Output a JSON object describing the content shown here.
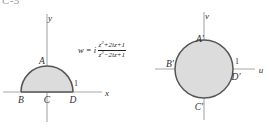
{
  "figure": {
    "corner_tag": "C-5",
    "background_color": "#ffffff",
    "fill_color": "#dcdcdc",
    "curve_color": "#555555",
    "axis_color": "#a8a8a8"
  },
  "mapping": {
    "lead": "w = i",
    "numerator": "z² + 2iz + 1",
    "denominator": "z² − 2iz + 1",
    "numerator_base": "z",
    "numerator_exp": "2",
    "numerator_rest": "+2iz+1",
    "denominator_base": "z",
    "denominator_exp": "2",
    "denominator_rest": "−2iz+1",
    "full": "w = i (z²+2iz+1)/(z²−2iz+1)"
  },
  "left_plane": {
    "name": "z-plane",
    "x_axis_label": "x",
    "y_axis_label": "y",
    "tick_label": "1",
    "region_description": "upper half unit disk (semicircle)",
    "points": [
      {
        "id": "A",
        "label": "A",
        "position": "top of semicircle"
      },
      {
        "id": "B",
        "label": "B",
        "position": "left end of diameter, x = -1"
      },
      {
        "id": "C",
        "label": "C",
        "position": "origin"
      },
      {
        "id": "D",
        "label": "D",
        "position": "right end of diameter, x = 1"
      }
    ]
  },
  "right_plane": {
    "name": "w-plane",
    "x_axis_label": "u",
    "y_axis_label": "v",
    "tick_label": "1",
    "region_description": "full unit disk",
    "points": [
      {
        "id": "A-prime",
        "label": "A′",
        "position": "top of circle"
      },
      {
        "id": "B-prime",
        "label": "B′",
        "position": "left of circle, u = -1"
      },
      {
        "id": "C-prime",
        "label": "C′",
        "position": "bottom of circle"
      },
      {
        "id": "D-prime",
        "label": "D′",
        "position": "right of circle, u = 1"
      }
    ]
  }
}
